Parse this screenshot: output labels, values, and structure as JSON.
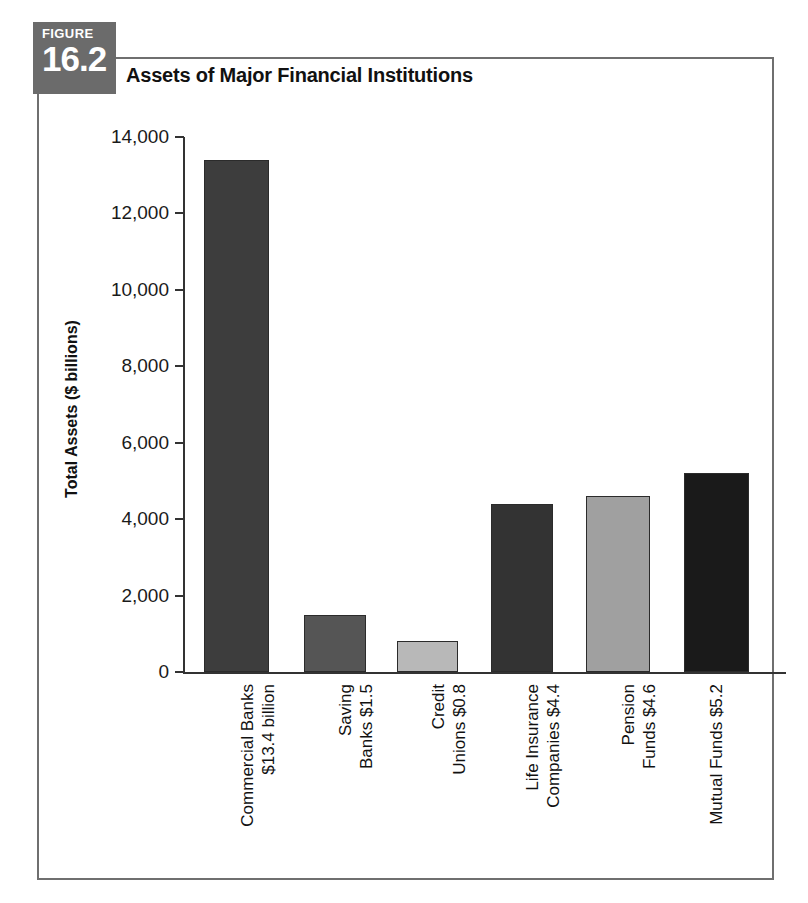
{
  "figure": {
    "badge_word": "FIGURE",
    "badge_number": "16.2",
    "title": "Assets of Major Financial Institutions"
  },
  "colors": {
    "badge_background": "#6b6b6b",
    "frame_border": "#6f6f6f",
    "axis": "#333333",
    "bar_commercial_banks": "#3d3d3d",
    "bar_saving_banks": "#555555",
    "bar_credit_unions": "#b8b8b8",
    "bar_life_insurance": "#333333",
    "bar_pension_funds": "#a0a0a0",
    "bar_mutual_funds": "#1a1a1a"
  },
  "chart_data": {
    "type": "bar",
    "title": "Assets of Major Financial Institutions",
    "xlabel": "",
    "ylabel": "Total Assets ($ billions)",
    "ylim": [
      0,
      14000
    ],
    "yticks": [
      0,
      2000,
      4000,
      6000,
      8000,
      10000,
      12000,
      14000
    ],
    "ytick_labels": [
      "0",
      "2,000",
      "4,000",
      "6,000",
      "8,000",
      "10,000",
      "12,000",
      "14,000"
    ],
    "grid": false,
    "legend": "none",
    "categories": [
      "Commercial Banks $13.4 billion",
      "Saving Banks $1.5",
      "Credit Unions $0.8",
      "Life Insurance Companies $4.4",
      "Pension Funds $4.6",
      "Mutual Funds $5.2"
    ],
    "category_lines": [
      [
        "Commercial Banks",
        "$13.4 billion"
      ],
      [
        "Saving",
        "Banks $1.5"
      ],
      [
        "Credit",
        "Unions $0.8"
      ],
      [
        "Life Insurance",
        "Companies $4.4"
      ],
      [
        "Pension",
        "Funds $4.6"
      ],
      [
        "Mutual Funds $5.2"
      ]
    ],
    "values": [
      13400,
      1500,
      800,
      4400,
      4600,
      5200
    ],
    "bar_colors": [
      "#3d3d3d",
      "#555555",
      "#b8b8b8",
      "#333333",
      "#a0a0a0",
      "#1a1a1a"
    ]
  }
}
